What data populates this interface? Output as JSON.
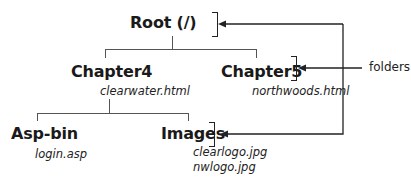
{
  "diagram": {
    "type": "folder-tree",
    "root": {
      "label": "Root (/)"
    },
    "nodes": [
      {
        "id": "chapter4",
        "label": "Chapter4",
        "files": [
          "clearwater.html"
        ]
      },
      {
        "id": "chapter5",
        "label": "Chapter5",
        "files": [
          "northwoods.html"
        ]
      },
      {
        "id": "aspbin",
        "label": "Asp-bin",
        "files": [
          "login.asp"
        ]
      },
      {
        "id": "images",
        "label": "Images",
        "files": [
          "clearlogo.jpg",
          "nwlogo.jpg"
        ]
      }
    ],
    "annotation": {
      "label": "folders"
    },
    "colors": {
      "line": "#555555",
      "text": "#1a1a1a"
    }
  }
}
